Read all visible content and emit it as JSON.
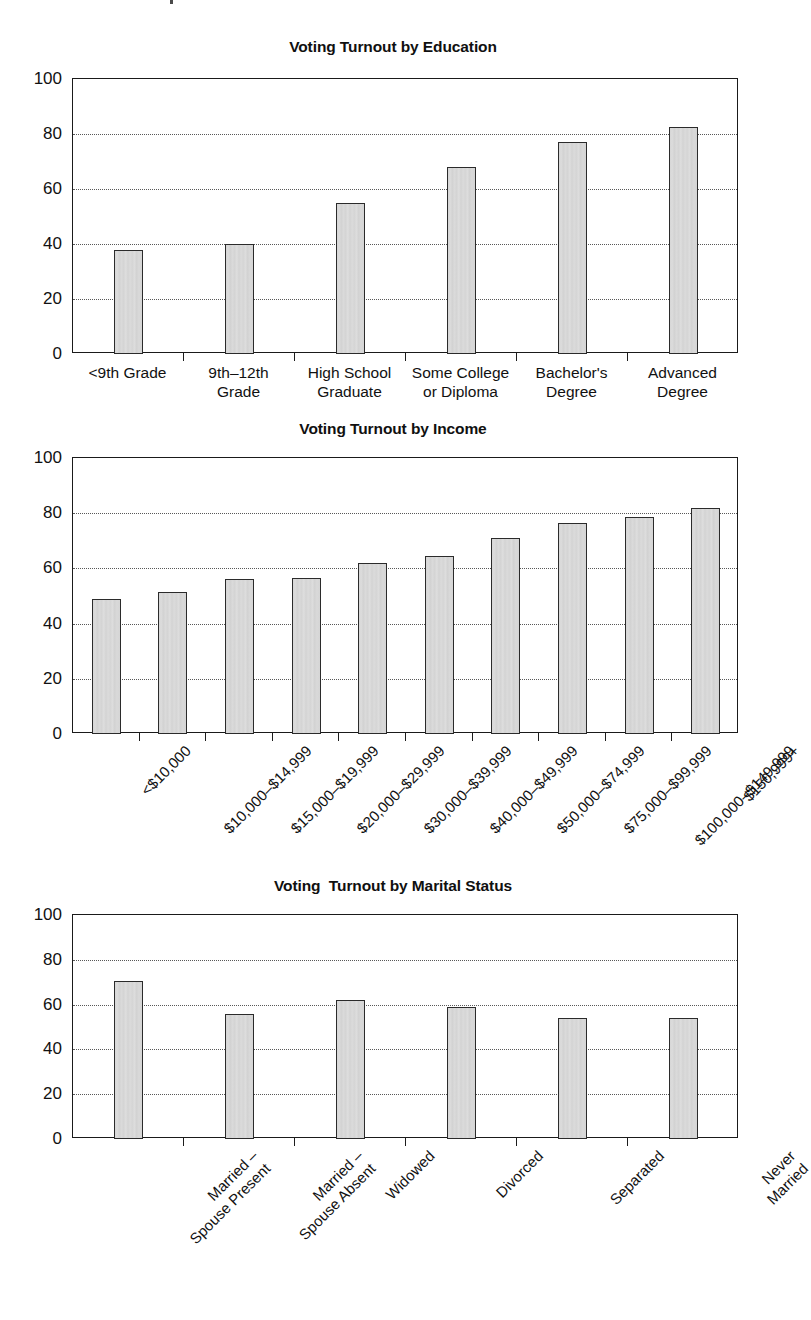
{
  "page": {
    "background": "#ffffff",
    "bar_fill": "#d8d8d8",
    "bar_stroke": "#2b2b2b",
    "grid_color": "#585858",
    "axis_color": "#1a1a1a"
  },
  "charts": [
    {
      "id": "voting-turnout-by-education",
      "title": "Voting Turnout by Education",
      "label_style": "horizontal"
    },
    {
      "id": "voting-turnout-by-income",
      "title": "Voting Turnout by Income",
      "label_style": "rotated"
    },
    {
      "id": "voting-turnout-by-marital-status",
      "title": "Voting  Turnout by Marital Status",
      "label_style": "rotated"
    }
  ],
  "chart_data": [
    {
      "type": "bar",
      "title": "Voting Turnout by Education",
      "xlabel": "",
      "ylabel": "",
      "ylim": [
        0,
        100
      ],
      "yticks": [
        0,
        20,
        40,
        60,
        80,
        100
      ],
      "grid": true,
      "legend": "none",
      "categories": [
        "<9th Grade",
        "9th–12th\nGrade",
        "High School\nGraduate",
        "Some College\nor Diploma",
        "Bachelor's\nDegree",
        "Advanced\nDegree"
      ],
      "values": [
        38,
        40,
        55,
        68,
        77,
        82.5
      ]
    },
    {
      "type": "bar",
      "title": "Voting Turnout by Income",
      "xlabel": "",
      "ylabel": "",
      "ylim": [
        0,
        100
      ],
      "yticks": [
        0,
        20,
        40,
        60,
        80,
        100
      ],
      "grid": true,
      "legend": "none",
      "categories": [
        "<$10,000",
        "$10,000–$14,999",
        "$15,000–$19,999",
        "$20,000–$29,999",
        "$30,000–$39,999",
        "$40,000–$49,999",
        "$50,000–$74,999",
        "$75,000–$99,999",
        "$100,000–$149,999",
        "$150,999+"
      ],
      "values": [
        49,
        51.5,
        56,
        56.5,
        62,
        64.5,
        71,
        76.5,
        78.5,
        82
      ]
    },
    {
      "type": "bar",
      "title": "Voting  Turnout by Marital Status",
      "xlabel": "",
      "ylabel": "",
      "ylim": [
        0,
        100
      ],
      "yticks": [
        0,
        20,
        40,
        60,
        80,
        100
      ],
      "grid": true,
      "legend": "none",
      "categories": [
        "Married –\nSpouse Present",
        "Married –\nSpouse Absent",
        "Widowed",
        "Divorced",
        "Separated",
        "Never Married"
      ],
      "values": [
        70.5,
        56,
        62,
        59,
        54,
        54
      ]
    }
  ]
}
